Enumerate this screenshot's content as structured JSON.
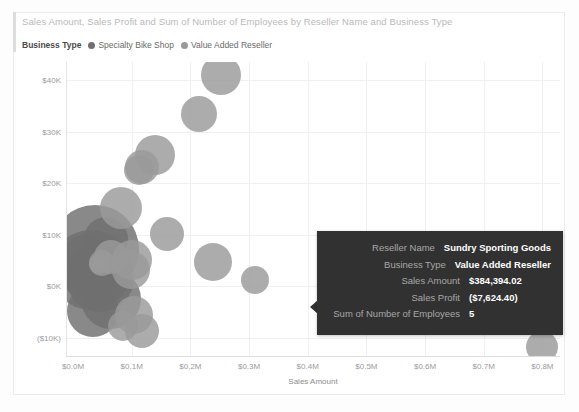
{
  "chart_title": "Sales Amount, Sales Profit and Sum of Number of Employees by Reseller Name and Business Type",
  "legend": {
    "title": "Business Type",
    "items": [
      {
        "label": "Specialty Bike Shop",
        "color": "#6f6f6f"
      },
      {
        "label": "Value Added Reseller",
        "color": "#9a9a9a"
      }
    ]
  },
  "tooltip": {
    "rows": [
      {
        "key": "Reseller Name",
        "value": "Sundry Sporting Goods"
      },
      {
        "key": "Business Type",
        "value": "Value Added Reseller"
      },
      {
        "key": "Sales Amount",
        "value": "$384,394.02"
      },
      {
        "key": "Sales Profit",
        "value": "($7,624.40)"
      },
      {
        "key": "Sum of Number of Employees",
        "value": "5"
      }
    ],
    "background": "#313131"
  },
  "chart_data": {
    "type": "scatter",
    "title": "Sales Amount, Sales Profit and Sum of Number of Employees by Reseller Name and Business Type",
    "xlabel": "Sales Amount",
    "ylabel": "Sales Profit",
    "xticks": [
      "$0.0M",
      "$0.1M",
      "$0.2M",
      "$0.3M",
      "$0.4M",
      "$0.5M",
      "$0.6M",
      "$0.7M",
      "$0.8M"
    ],
    "xtick_values": [
      0.0,
      0.1,
      0.2,
      0.3,
      0.4,
      0.5,
      0.6,
      0.7,
      0.8
    ],
    "yticks": [
      "$40K",
      "$30K",
      "$20K",
      "$10K",
      "$0K",
      "($10K)"
    ],
    "ytick_values": [
      40000,
      30000,
      20000,
      10000,
      0,
      -10000
    ],
    "xlim": [
      -0.012,
      0.83
    ],
    "ylim": [
      -13500,
      43500
    ],
    "grid": true,
    "legend_position": "top-left",
    "size_encoding": "Sum of Number of Employees",
    "series": [
      {
        "name": "Specialty Bike Shop",
        "color": "#6f6f6f",
        "points": [
          {
            "x": 0.038,
            "y": 7200,
            "r": 44
          },
          {
            "x": 0.03,
            "y": 3200,
            "r": 40
          },
          {
            "x": 0.046,
            "y": 1600,
            "r": 34
          },
          {
            "x": 0.022,
            "y": 5000,
            "r": 26
          },
          {
            "x": 0.056,
            "y": 9200,
            "r": 22
          },
          {
            "x": 0.014,
            "y": 2600,
            "r": 18
          },
          {
            "x": 0.064,
            "y": -2400,
            "r": 30
          },
          {
            "x": 0.034,
            "y": -4800,
            "r": 26
          },
          {
            "x": 0.01,
            "y": 800,
            "r": 14
          }
        ]
      },
      {
        "name": "Value Added Reseller",
        "color": "#9a9a9a",
        "points": [
          {
            "x": 0.082,
            "y": 15200,
            "r": 21
          },
          {
            "x": 0.14,
            "y": 25500,
            "r": 20
          },
          {
            "x": 0.118,
            "y": 23200,
            "r": 17
          },
          {
            "x": 0.112,
            "y": 22600,
            "r": 15
          },
          {
            "x": 0.214,
            "y": 33500,
            "r": 18
          },
          {
            "x": 0.252,
            "y": 41000,
            "r": 20
          },
          {
            "x": 0.16,
            "y": 10200,
            "r": 17
          },
          {
            "x": 0.1,
            "y": 5200,
            "r": 20
          },
          {
            "x": 0.238,
            "y": 4800,
            "r": 19
          },
          {
            "x": 0.31,
            "y": 1200,
            "r": 14
          },
          {
            "x": 0.098,
            "y": 3200,
            "r": 19
          },
          {
            "x": 0.064,
            "y": 5600,
            "r": 17
          },
          {
            "x": 0.104,
            "y": -5600,
            "r": 19
          },
          {
            "x": 0.118,
            "y": -8600,
            "r": 17
          },
          {
            "x": 0.05,
            "y": 4600,
            "r": 13
          },
          {
            "x": 0.044,
            "y": 4400,
            "r": 10
          },
          {
            "x": 0.042,
            "y": 4300,
            "r": 7
          },
          {
            "x": 0.086,
            "y": -7600,
            "r": 15
          },
          {
            "x": 0.8,
            "y": -11800,
            "r": 16
          }
        ]
      }
    ]
  }
}
